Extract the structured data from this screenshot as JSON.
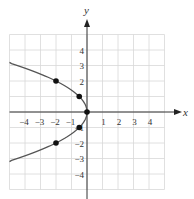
{
  "chart_data": {
    "type": "scatter",
    "title": "",
    "xlabel": "x",
    "ylabel": "y",
    "xlim": [
      -5,
      5
    ],
    "ylim": [
      -5,
      5
    ],
    "grid": true,
    "x_ticks": [
      -4,
      -3,
      -2,
      -1,
      1,
      2,
      3,
      4
    ],
    "y_ticks": [
      4,
      3,
      2,
      1,
      -1,
      -2,
      -3,
      -4
    ],
    "x_tick_labels": [
      "−4",
      "−3",
      "−2",
      "−1",
      "1",
      "2",
      "3",
      "4"
    ],
    "y_tick_labels": [
      "4",
      "3",
      "2",
      "−1",
      "−2",
      "−3",
      "−4"
    ],
    "curve": {
      "equation": "x = -y^2/2",
      "y_range": [
        -3.2,
        3.2
      ]
    },
    "points": [
      {
        "x": 0,
        "y": 0
      },
      {
        "x": -0.5,
        "y": 1
      },
      {
        "x": -0.5,
        "y": -1
      },
      {
        "x": -2,
        "y": 2
      },
      {
        "x": -2,
        "y": -2
      }
    ]
  }
}
